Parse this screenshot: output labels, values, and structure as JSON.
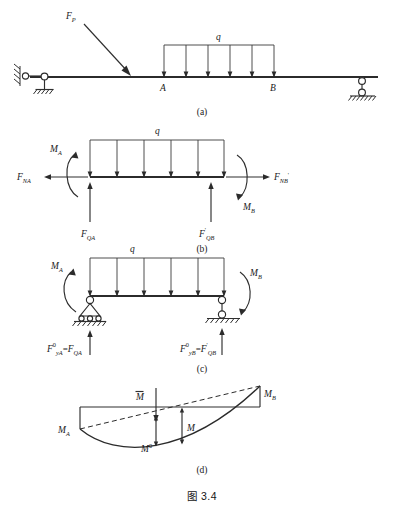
{
  "figure": {
    "caption": "图 3.4",
    "panels": [
      {
        "tag": "(a)",
        "name": "original-structure",
        "labels": {
          "point_load": "F",
          "point_load_sub": "P",
          "distributed_load": "q",
          "node_a": "A",
          "node_b": "B"
        }
      },
      {
        "tag": "(b)",
        "name": "free-body-segment",
        "labels": {
          "distributed_load": "q",
          "moment_a": "M",
          "moment_a_sub": "A",
          "moment_b": "M",
          "moment_b_sub": "B",
          "axial_a": "F",
          "axial_a_sub": "NA",
          "axial_b": "F",
          "axial_b_sub": "NB",
          "axial_b_prime": "'",
          "shear_a": "F",
          "shear_a_sub": "QA",
          "shear_b": "F",
          "shear_b_sub": "QB",
          "shear_b_prime": "'"
        }
      },
      {
        "tag": "(c)",
        "name": "equivalent-simply-supported-beam",
        "labels": {
          "distributed_load": "q",
          "moment_a": "M",
          "moment_a_sub": "A",
          "moment_b": "M",
          "moment_b_sub": "B",
          "reaction_a": "F",
          "reaction_a_sup": "0",
          "reaction_a_sub": "yA",
          "reaction_a_eq": "=",
          "reaction_a_rhs": "F",
          "reaction_a_rhs_sub": "QA",
          "reaction_b": "F",
          "reaction_b_sup": "0",
          "reaction_b_sub": "yB",
          "reaction_b_eq": "=",
          "reaction_b_rhs": "F",
          "reaction_b_rhs_prime": "'",
          "reaction_b_rhs_sub": "QB"
        }
      },
      {
        "tag": "(d)",
        "name": "bending-moment-diagram",
        "labels": {
          "moment_a": "M",
          "moment_a_sub": "A",
          "moment_b": "M",
          "moment_b_sub": "B",
          "moment_mean": "M",
          "moment_zero": "M",
          "moment_zero_sup": "0",
          "moment_total": "M"
        }
      }
    ]
  },
  "style": {
    "ink": "#2b2b2b",
    "paper": "#ffffff"
  }
}
